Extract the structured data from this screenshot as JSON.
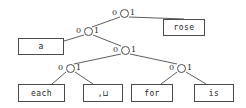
{
  "figure": {
    "kind": "binary-code-tree",
    "colors": {
      "stroke": "#4a4a4a",
      "text": "#1c1c1c",
      "label": "#2b2b2b",
      "background": "#ffffff"
    }
  },
  "nodes": [
    {
      "id": "root",
      "name": "root-node",
      "x": 124,
      "y": 13
    },
    {
      "id": "n2",
      "name": "internal-node-2",
      "x": 88,
      "y": 31
    },
    {
      "id": "n3",
      "name": "internal-node-3",
      "x": 125,
      "y": 50
    },
    {
      "id": "n4l",
      "name": "internal-node-4-left",
      "x": 70,
      "y": 68
    },
    {
      "id": "n4r",
      "name": "internal-node-4-right",
      "x": 181,
      "y": 68
    }
  ],
  "bit_labels": [
    {
      "bit": "0",
      "x": 112,
      "y": 9,
      "name": "bit-label-root-left"
    },
    {
      "bit": "1",
      "x": 130,
      "y": 9,
      "name": "bit-label-root-right"
    },
    {
      "bit": "0",
      "x": 76,
      "y": 27,
      "name": "bit-label-n2-left"
    },
    {
      "bit": "1",
      "x": 94,
      "y": 27,
      "name": "bit-label-n2-right"
    },
    {
      "bit": "0",
      "x": 113,
      "y": 46,
      "name": "bit-label-n3-left"
    },
    {
      "bit": "1",
      "x": 131,
      "y": 46,
      "name": "bit-label-n3-right"
    },
    {
      "bit": "0",
      "x": 58,
      "y": 64,
      "name": "bit-label-n4l-left"
    },
    {
      "bit": "1",
      "x": 76,
      "y": 64,
      "name": "bit-label-n4l-right"
    },
    {
      "bit": "0",
      "x": 169,
      "y": 64,
      "name": "bit-label-n4r-left"
    },
    {
      "bit": "1",
      "x": 187,
      "y": 64,
      "name": "bit-label-n4r-right"
    }
  ],
  "leaves": [
    {
      "id": "rose",
      "name": "leaf-box-rose",
      "label": "rose",
      "code": "1",
      "x": 163,
      "y": 19,
      "w": 42,
      "h": 17
    },
    {
      "id": "a",
      "name": "leaf-box-a",
      "label": "a",
      "code": "00",
      "x": 18,
      "y": 38,
      "w": 46,
      "h": 17
    },
    {
      "id": "each",
      "name": "leaf-box-each",
      "label": "each",
      "code": "01000",
      "x": 18,
      "y": 84,
      "w": 47,
      "h": 18
    },
    {
      "id": "comma_space",
      "name": "leaf-box-comma-space",
      "label": ",⊔",
      "code": "01001",
      "x": 83,
      "y": 84,
      "w": 40,
      "h": 18
    },
    {
      "id": "for",
      "name": "leaf-box-for",
      "label": "for",
      "code": "01010",
      "x": 131,
      "y": 84,
      "w": 42,
      "h": 18
    },
    {
      "id": "is",
      "name": "leaf-box-is",
      "label": "is",
      "code": "01011",
      "x": 194,
      "y": 84,
      "w": 40,
      "h": 18
    }
  ],
  "edges": [
    {
      "name": "edge-root-to-n2",
      "from": "root",
      "to": "n2",
      "bit": "0",
      "x1": 120,
      "y1": 17,
      "x2": 92,
      "y2": 27
    },
    {
      "name": "edge-root-to-rose",
      "from": "root",
      "to": "rose",
      "bit": "1",
      "x1": 129,
      "y1": 17,
      "x2": 184,
      "y2": 19
    },
    {
      "name": "edge-n2-to-a",
      "from": "n2",
      "to": "a",
      "bit": "0",
      "x1": 84,
      "y1": 35,
      "x2": 64,
      "y2": 41
    },
    {
      "name": "edge-n2-to-n3",
      "from": "n2",
      "to": "n3",
      "bit": "1",
      "x1": 93,
      "y1": 35,
      "x2": 121,
      "y2": 46
    },
    {
      "name": "edge-n3-to-n4l",
      "from": "n3",
      "to": "n4l",
      "bit": "0",
      "x1": 121,
      "y1": 54,
      "x2": 74,
      "y2": 64
    },
    {
      "name": "edge-n3-to-n4r",
      "from": "n3",
      "to": "n4r",
      "bit": "1",
      "x1": 130,
      "y1": 54,
      "x2": 177,
      "y2": 64
    },
    {
      "name": "edge-n4l-to-each",
      "from": "n4l",
      "to": "each",
      "bit": "0",
      "x1": 66,
      "y1": 72,
      "x2": 52,
      "y2": 84
    },
    {
      "name": "edge-n4l-to-comma",
      "from": "n4l",
      "to": "comma_space",
      "bit": "1",
      "x1": 75,
      "y1": 72,
      "x2": 93,
      "y2": 84
    },
    {
      "name": "edge-n4r-to-for",
      "from": "n4r",
      "to": "for",
      "bit": "0",
      "x1": 177,
      "y1": 72,
      "x2": 161,
      "y2": 84
    },
    {
      "name": "edge-n4r-to-is",
      "from": "n4r",
      "to": "is",
      "bit": "1",
      "x1": 186,
      "y1": 72,
      "x2": 206,
      "y2": 84
    }
  ]
}
